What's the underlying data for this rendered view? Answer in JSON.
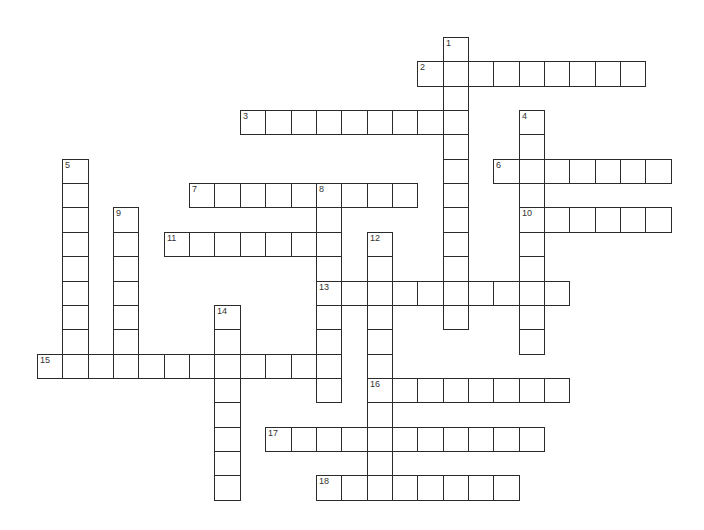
{
  "puzzle": {
    "type": "crossword",
    "grid": {
      "origin_x": 37,
      "origin_y": 37,
      "cell_w": 25.35,
      "cell_h": 24.35,
      "line_color": "#2b2b2b",
      "background": "#ffffff"
    },
    "words": [
      {
        "num": "1",
        "dir": "down",
        "row": 0,
        "col": 16,
        "len": 12
      },
      {
        "num": "2",
        "dir": "across",
        "row": 1,
        "col": 15,
        "len": 9
      },
      {
        "num": "3",
        "dir": "across",
        "row": 3,
        "col": 8,
        "len": 9
      },
      {
        "num": "4",
        "dir": "down",
        "row": 3,
        "col": 19,
        "len": 10
      },
      {
        "num": "5",
        "dir": "down",
        "row": 5,
        "col": 1,
        "len": 9
      },
      {
        "num": "6",
        "dir": "across",
        "row": 5,
        "col": 18,
        "len": 7
      },
      {
        "num": "7",
        "dir": "across",
        "row": 6,
        "col": 6,
        "len": 9
      },
      {
        "num": "8",
        "dir": "down",
        "row": 6,
        "col": 11,
        "len": 9
      },
      {
        "num": "9",
        "dir": "down",
        "row": 7,
        "col": 3,
        "len": 7
      },
      {
        "num": "10",
        "dir": "across",
        "row": 7,
        "col": 19,
        "len": 6
      },
      {
        "num": "11",
        "dir": "across",
        "row": 8,
        "col": 5,
        "len": 7
      },
      {
        "num": "12",
        "dir": "down",
        "row": 8,
        "col": 13,
        "len": 11
      },
      {
        "num": "13",
        "dir": "across",
        "row": 10,
        "col": 11,
        "len": 10
      },
      {
        "num": "14",
        "dir": "down",
        "row": 11,
        "col": 7,
        "len": 8
      },
      {
        "num": "15",
        "dir": "across",
        "row": 13,
        "col": 0,
        "len": 12
      },
      {
        "num": "16",
        "dir": "across",
        "row": 14,
        "col": 13,
        "len": 8
      },
      {
        "num": "17",
        "dir": "across",
        "row": 16,
        "col": 9,
        "len": 11
      },
      {
        "num": "18",
        "dir": "across",
        "row": 18,
        "col": 11,
        "len": 8
      }
    ]
  }
}
